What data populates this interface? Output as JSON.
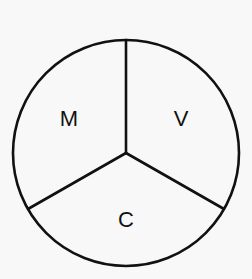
{
  "figure": {
    "kind": "divided-circle-diagram",
    "background_color": "#f8f8f8",
    "stroke_color": "#111111",
    "label_color": "#111111"
  },
  "circle": {
    "center_x": 126,
    "center_y": 153,
    "radius": 113,
    "stroke_width": 2.6
  },
  "spokes": [
    {
      "name": "spoke-up",
      "angle_degrees": 90,
      "end_x": 126,
      "end_y": 40,
      "stroke_width": 2.6
    },
    {
      "name": "spoke-lower-left",
      "angle_degrees": 210,
      "end_x": 28,
      "end_y": 209,
      "stroke_width": 2.6
    },
    {
      "name": "spoke-lower-right",
      "angle_degrees": 330,
      "end_x": 224,
      "end_y": 209,
      "stroke_width": 2.6
    }
  ],
  "sectors": [
    {
      "name": "sector-m",
      "label": "M",
      "label_x": 69,
      "label_y": 120,
      "font_size": 22
    },
    {
      "name": "sector-v",
      "label": "V",
      "label_x": 181,
      "label_y": 120,
      "font_size": 22
    },
    {
      "name": "sector-c",
      "label": "C",
      "label_x": 126,
      "label_y": 221,
      "font_size": 22
    }
  ]
}
